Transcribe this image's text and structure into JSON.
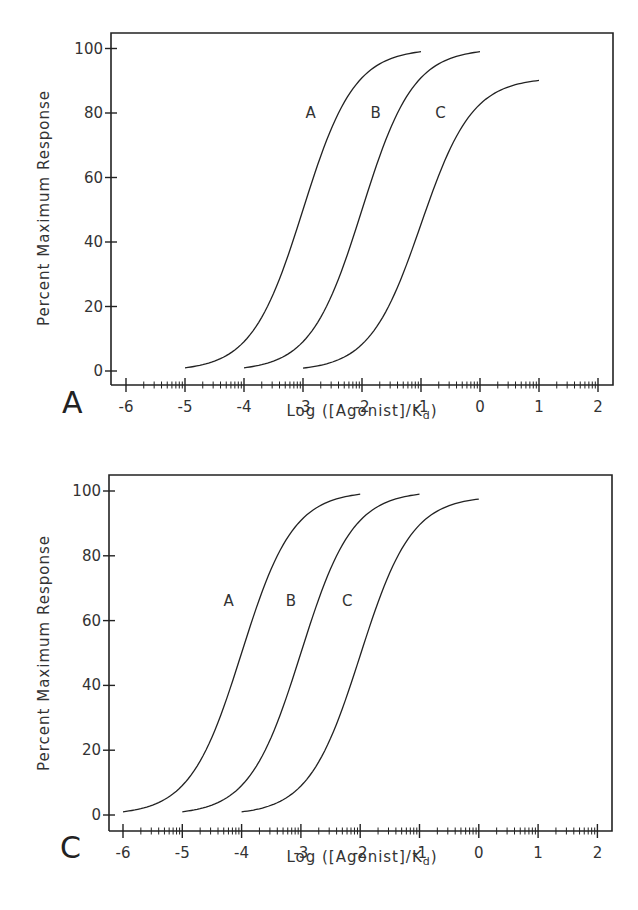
{
  "chart_data": [
    {
      "panel": "A",
      "type": "line",
      "title": "",
      "xlabel": "Log ([Agonist]/K_d)",
      "xlabel_main": "Log ([Agonist]/K",
      "xlabel_sub": "d",
      "xlabel_close": ")",
      "ylabel": "Percent Maximum Response",
      "xlim": [
        -6.25,
        2.25
      ],
      "ylim": [
        -4,
        104
      ],
      "x_ticks": [
        -6,
        -5,
        -4,
        -3,
        -2,
        -1,
        0,
        1,
        2
      ],
      "x_tick_labels": [
        "-6",
        "-5",
        "-4",
        "-3",
        "-2",
        "-1",
        "0",
        "1",
        "2"
      ],
      "y_ticks": [
        0,
        20,
        40,
        60,
        80,
        100
      ],
      "y_tick_labels": [
        "0",
        "20",
        "40",
        "60",
        "80",
        "100"
      ],
      "x_minor_ticks": "log",
      "grid": false,
      "legend": "inline labels",
      "series": [
        {
          "name": "A",
          "ec50": -3,
          "max": 100,
          "x_start": -5,
          "x_end": -1,
          "label_x": -2.7,
          "label_y": 80,
          "x": [
            -5,
            -4.5,
            -4,
            -3.5,
            -3,
            -2.5,
            -2,
            -1.5,
            -1
          ],
          "values": [
            1.0,
            3.1,
            9.1,
            24.0,
            50.0,
            76.0,
            90.9,
            96.9,
            99.0
          ]
        },
        {
          "name": "B",
          "ec50": -2,
          "max": 100,
          "x_start": -4,
          "x_end": 0,
          "label_x": -1.6,
          "label_y": 80,
          "x": [
            -4,
            -3.5,
            -3,
            -2.5,
            -2,
            -1.5,
            -1,
            -0.5,
            0
          ],
          "values": [
            1.0,
            3.1,
            9.1,
            24.0,
            50.0,
            76.0,
            90.9,
            96.9,
            99.0
          ]
        },
        {
          "name": "C",
          "ec50": -1,
          "max": 91,
          "x_start": -3,
          "x_end": 1,
          "label_x": -0.5,
          "label_y": 80,
          "x": [
            -3,
            -2.5,
            -2,
            -1.5,
            -1,
            -0.5,
            0,
            0.5,
            1
          ],
          "values": [
            0.9,
            2.8,
            8.3,
            21.8,
            45.5,
            69.2,
            82.7,
            88.2,
            90.1
          ]
        }
      ]
    },
    {
      "panel": "C",
      "type": "line",
      "title": "",
      "xlabel": "Log ([Agonist]/K_d)",
      "xlabel_main": "Log ([Agonist]/K",
      "xlabel_sub": "d",
      "xlabel_close": ")",
      "ylabel": "Percent Maximum Response",
      "xlim": [
        -6.25,
        2.25
      ],
      "ylim": [
        -4,
        104
      ],
      "x_ticks": [
        -6,
        -5,
        -4,
        -3,
        -2,
        -1,
        0,
        1,
        2
      ],
      "x_tick_labels": [
        "-6",
        "-5",
        "-4",
        "-3",
        "-2",
        "-1",
        "0",
        "1",
        "2"
      ],
      "y_ticks": [
        0,
        20,
        40,
        60,
        80,
        100
      ],
      "y_tick_labels": [
        "0",
        "20",
        "40",
        "60",
        "80",
        "100"
      ],
      "x_minor_ticks": "log",
      "grid": false,
      "legend": "inline labels",
      "series": [
        {
          "name": "A",
          "ec50": -4,
          "max": 100,
          "x_start": -6,
          "x_end": -2,
          "label_x": -4.05,
          "label_y": 66,
          "x": [
            -6,
            -5.5,
            -5,
            -4.5,
            -4,
            -3.5,
            -3,
            -2.5,
            -2
          ],
          "values": [
            1.0,
            3.1,
            9.1,
            24.0,
            50.0,
            76.0,
            90.9,
            96.9,
            99.0
          ]
        },
        {
          "name": "B",
          "ec50": -3,
          "max": 100,
          "x_start": -5,
          "x_end": -1,
          "label_x": -3.0,
          "label_y": 66,
          "x": [
            -5,
            -4.5,
            -4,
            -3.5,
            -3,
            -2.5,
            -2,
            -1.5,
            -1
          ],
          "values": [
            1.0,
            3.1,
            9.1,
            24.0,
            50.0,
            76.0,
            90.9,
            96.9,
            99.0
          ]
        },
        {
          "name": "C",
          "ec50": -2,
          "max": 98.5,
          "x_start": -4,
          "x_end": 0,
          "label_x": -2.05,
          "label_y": 66,
          "x": [
            -4,
            -3.5,
            -3,
            -2.5,
            -2,
            -1.5,
            -1,
            -0.5,
            0
          ],
          "values": [
            1.0,
            3.0,
            9.0,
            23.6,
            49.3,
            74.9,
            89.5,
            95.4,
            97.5
          ]
        }
      ]
    }
  ],
  "panels": {
    "a": {
      "letter": "A",
      "ylabel": "Percent Maximum Response",
      "xlabel_main": "Log ([Agonist]/K",
      "xlabel_sub": "d",
      "xlabel_close": ")"
    },
    "c": {
      "letter": "C",
      "ylabel": "Percent Maximum Response",
      "xlabel_main": "Log ([Agonist]/K",
      "xlabel_sub": "d",
      "xlabel_close": ")"
    }
  },
  "colors": {
    "ink": "#222222",
    "background": "#ffffff"
  }
}
